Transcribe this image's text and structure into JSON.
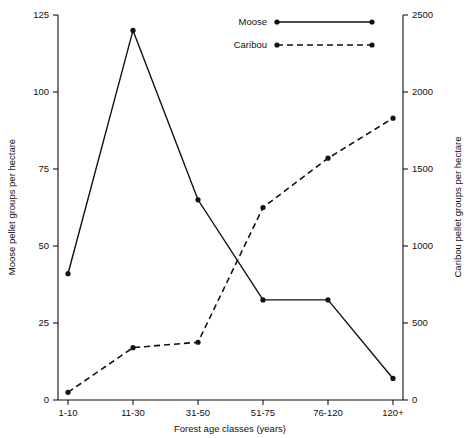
{
  "chart_data": {
    "type": "line",
    "title": "",
    "xlabel": "Forest age classes (years)",
    "categories": [
      "1-10",
      "11-30",
      "31-50",
      "51-75",
      "76-120",
      "120+"
    ],
    "grid": false,
    "legend_position": "top-right",
    "series": [
      {
        "name": "Moose",
        "axis": "left",
        "linestyle": "solid",
        "marker": "filled-circle",
        "color": "#111111",
        "values": [
          41,
          120,
          65,
          32.5,
          32.5,
          7
        ]
      },
      {
        "name": "Caribou",
        "axis": "right",
        "linestyle": "dashed",
        "marker": "filled-circle",
        "color": "#111111",
        "values": [
          50,
          340,
          375,
          1250,
          1570,
          1830
        ]
      }
    ],
    "axes": {
      "left": {
        "label": "Moose pellet groups per hectare",
        "ylim": [
          0,
          125
        ],
        "ticks": [
          0,
          25,
          50,
          75,
          100,
          125
        ],
        "tick_labels": [
          "0",
          "25",
          "50",
          "75",
          "100",
          "125"
        ]
      },
      "right": {
        "label": "Caribou pellet groups per hectare",
        "ylim": [
          0,
          2500
        ],
        "ticks": [
          0,
          500,
          1000,
          1500,
          2000,
          2500
        ],
        "tick_labels": [
          "0",
          "500",
          "1000",
          "1500",
          "2000",
          "2500"
        ]
      },
      "bottom": {
        "label": "Forest age classes (years)",
        "tick_labels": [
          "1-10",
          "11-30",
          "31-50",
          "51-75",
          "76-120",
          "120+"
        ]
      }
    },
    "legend": [
      {
        "label": "Moose",
        "linestyle": "solid"
      },
      {
        "label": "Caribou",
        "linestyle": "dashed"
      }
    ]
  }
}
